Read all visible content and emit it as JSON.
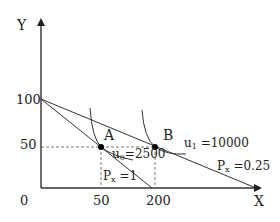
{
  "diagram": {
    "type": "consumer-choice",
    "axes": {
      "x_label": "X",
      "y_label": "Y",
      "origin_label": "0",
      "x_ticks": [
        "50",
        "200"
      ],
      "y_ticks": [
        "100",
        "50"
      ]
    },
    "points": [
      {
        "name": "A",
        "x": 50,
        "y": 50
      },
      {
        "name": "B",
        "x": 200,
        "y": 50
      }
    ],
    "budget_lines": [
      {
        "label_main": "P",
        "label_sub": "x",
        "label_rest": " =1",
        "y_intercept": 100,
        "x_intercept": 100
      },
      {
        "label_main": "P",
        "label_sub": "x",
        "label_rest": " =0.25",
        "y_intercept": 100,
        "x_intercept": 400
      }
    ],
    "indifference_curves": [
      {
        "label_main": "u",
        "label_sub": "0",
        "label_rest": "=2500",
        "tangent_point": "A"
      },
      {
        "label_main": "u",
        "label_sub": "1",
        "label_rest": " =10000",
        "tangent_point": "B"
      }
    ],
    "colors": {
      "line": "#333333",
      "dashed": "#555555",
      "point": "#000000"
    }
  }
}
